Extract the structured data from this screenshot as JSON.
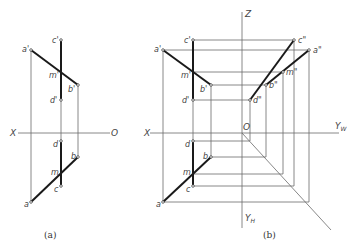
{
  "figure_a": {
    "caption": "(a)",
    "axis": {
      "x_label": "X",
      "origin_label": "O"
    },
    "front_view_points": {
      "a": "a'",
      "b": "b'",
      "c": "c'",
      "d": "d'",
      "m": "m'"
    },
    "top_view_points": {
      "a": "a",
      "b": "b",
      "c": "c",
      "d": "d",
      "m": "m"
    }
  },
  "figure_b": {
    "caption": "(b)",
    "axis": {
      "x_label": "X",
      "z_label": "Z",
      "origin_label": "O",
      "yw_label": "Y",
      "yw_sub": "W",
      "yh_label": "Y",
      "yh_sub": "H"
    },
    "front_view_points": {
      "a": "a'",
      "b": "b'",
      "c": "c'",
      "d": "d'",
      "m": "m'"
    },
    "side_view_points": {
      "a": "a\"",
      "b": "b\"",
      "c": "c\"",
      "d": "d\"",
      "m": "m\""
    },
    "top_view_points": {
      "a": "a",
      "b": "b",
      "c": "c",
      "d": "d",
      "m": "m"
    }
  }
}
